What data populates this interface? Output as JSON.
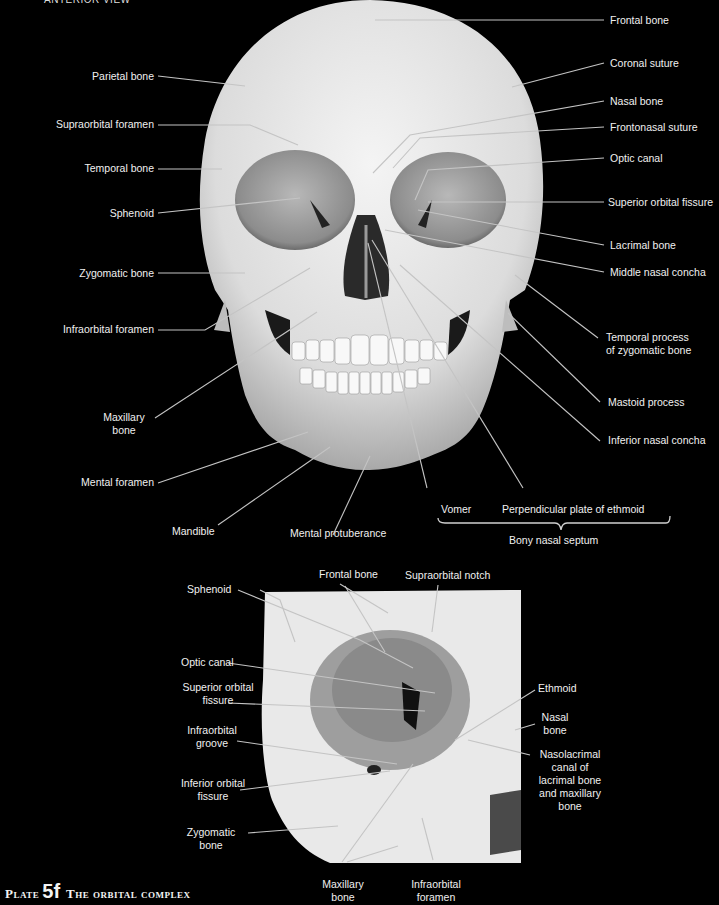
{
  "header": {
    "cut_off_text": "ANTERIOR VIEW"
  },
  "main_figure": {
    "left_labels": [
      {
        "id": "parietal",
        "text": "Parietal bone"
      },
      {
        "id": "supraorbital-foramen",
        "text": "Supraorbital foramen"
      },
      {
        "id": "temporal",
        "text": "Temporal bone"
      },
      {
        "id": "sphenoid",
        "text": "Sphenoid"
      },
      {
        "id": "zygomatic",
        "text": "Zygomatic bone"
      },
      {
        "id": "infraorbital-foramen",
        "text": "Infraorbital foramen"
      },
      {
        "id": "maxillary",
        "text": "Maxillary\nbone"
      },
      {
        "id": "mental-foramen",
        "text": "Mental foramen"
      },
      {
        "id": "mandible",
        "text": "Mandible"
      },
      {
        "id": "mental-protuberance",
        "text": "Mental protuberance"
      }
    ],
    "right_labels": [
      {
        "id": "frontal",
        "text": "Frontal bone"
      },
      {
        "id": "coronal",
        "text": "Coronal suture"
      },
      {
        "id": "nasal",
        "text": "Nasal bone"
      },
      {
        "id": "frontonasal",
        "text": "Frontonasal suture"
      },
      {
        "id": "optic",
        "text": "Optic canal"
      },
      {
        "id": "sup-orbital-fissure",
        "text": "Superior orbital fissure"
      },
      {
        "id": "lacrimal",
        "text": "Lacrimal bone"
      },
      {
        "id": "middle-concha",
        "text": "Middle nasal concha"
      },
      {
        "id": "temporal-process",
        "text": "Temporal process\nof zygomatic bone"
      },
      {
        "id": "mastoid",
        "text": "Mastoid process"
      },
      {
        "id": "inferior-concha",
        "text": "Inferior nasal concha"
      }
    ],
    "septum": {
      "vomer": "Vomer",
      "perpendicular_plate": "Perpendicular plate of ethmoid",
      "group_label": "Bony nasal septum"
    }
  },
  "inset_figure": {
    "labels": {
      "frontal": "Frontal bone",
      "supraorbital_notch": "Supraorbital notch",
      "sphenoid": "Sphenoid",
      "optic_canal": "Optic canal",
      "sup_orbital_fissure": "Superior orbital\nfissure",
      "infraorbital_groove": "Infraorbital\ngroove",
      "inf_orbital_fissure": "Inferior orbital\nfissure",
      "zygomatic": "Zygomatic\nbone",
      "ethmoid": "Ethmoid",
      "nasal": "Nasal\nbone",
      "nasolacrimal": "Nasolacrimal\ncanal of\nlacrimal bone\nand maxillary\nbone",
      "maxillary": "Maxillary\nbone",
      "infraorbital_foramen": "Infraorbital\nforamen"
    }
  },
  "plate": {
    "word": "Plate",
    "number": "5f",
    "title": "The orbital complex"
  },
  "colors": {
    "background": "#000000",
    "label_text": "#f0f0f0",
    "leader_line": "#bdbdbd",
    "bone": "#e6e6e6"
  }
}
